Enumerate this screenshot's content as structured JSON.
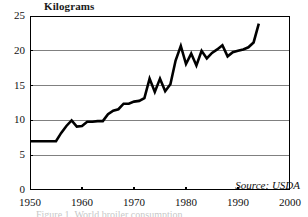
{
  "figure": {
    "y_unit_label": "Kilograms",
    "source_note": "Source: USDA",
    "caption": "Figure 1. World broiler consumption",
    "colors": {
      "line": "#000000",
      "grid": "#808080",
      "axis": "#000000",
      "text": "#111111",
      "background": "#ffffff"
    }
  },
  "chart_data": {
    "type": "line",
    "title": "",
    "subtitle": "",
    "xlabel": "",
    "ylabel": "Kilograms",
    "xlim": [
      1950,
      2000
    ],
    "ylim": [
      0,
      25
    ],
    "grid": true,
    "legend": null,
    "annotations": [
      "Source: USDA"
    ],
    "xticks": [
      1950,
      1960,
      1970,
      1980,
      1990,
      2000
    ],
    "xtick_labels": [
      "1950",
      "1960",
      "1970",
      "1980",
      "1990",
      "2000"
    ],
    "yticks": [
      0,
      5,
      10,
      15,
      20,
      25
    ],
    "ytick_labels": [
      "0",
      "5",
      "10",
      "15",
      "20",
      "25"
    ],
    "series": [
      {
        "name": "Kilograms",
        "x": [
          1950,
          1951,
          1952,
          1953,
          1954,
          1955,
          1956,
          1957,
          1958,
          1959,
          1960,
          1961,
          1962,
          1963,
          1964,
          1965,
          1966,
          1967,
          1968,
          1969,
          1970,
          1971,
          1972,
          1973,
          1974,
          1975,
          1976,
          1977,
          1978,
          1979,
          1980,
          1981,
          1982,
          1983,
          1984,
          1985,
          1986,
          1987,
          1988,
          1989,
          1990,
          1991,
          1992,
          1993,
          1994
        ],
        "values": [
          7.0,
          7.0,
          7.0,
          7.0,
          7.0,
          7.0,
          8.2,
          9.2,
          10.0,
          9.1,
          9.2,
          9.8,
          9.8,
          9.9,
          9.9,
          10.9,
          11.4,
          11.6,
          12.4,
          12.4,
          12.7,
          12.8,
          13.2,
          16.0,
          14.1,
          16.0,
          14.2,
          15.2,
          18.6,
          20.7,
          18.1,
          19.6,
          17.9,
          20.0,
          18.9,
          19.7,
          20.2,
          20.8,
          19.2,
          19.8,
          20.0,
          20.2,
          20.5,
          21.2,
          23.9
        ]
      }
    ]
  }
}
